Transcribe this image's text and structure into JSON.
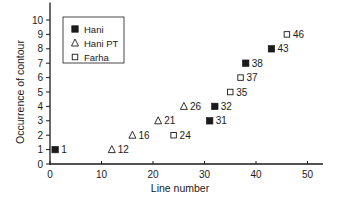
{
  "chart_data": {
    "type": "scatter",
    "title": "",
    "xlabel": "Line number",
    "ylabel": "Occurrence of contour",
    "xlim": [
      0,
      53
    ],
    "ylim": [
      0,
      10.8
    ],
    "xticks": [
      0,
      10,
      20,
      30,
      40,
      50
    ],
    "yticks": [
      0,
      1,
      2,
      3,
      4,
      5,
      6,
      7,
      8,
      9,
      10
    ],
    "grid": false,
    "legend_position": "upper-left",
    "series": [
      {
        "name": "Hani",
        "marker": "filled-square",
        "points": [
          {
            "x": 1,
            "y": 1,
            "label": "1"
          },
          {
            "x": 31,
            "y": 3,
            "label": "31"
          },
          {
            "x": 32,
            "y": 4,
            "label": "32"
          },
          {
            "x": 38,
            "y": 7,
            "label": "38"
          },
          {
            "x": 43,
            "y": 8,
            "label": "43"
          }
        ]
      },
      {
        "name": "Hani PT",
        "marker": "open-triangle",
        "points": [
          {
            "x": 12,
            "y": 1,
            "label": "12"
          },
          {
            "x": 16,
            "y": 2,
            "label": "16"
          },
          {
            "x": 21,
            "y": 3,
            "label": "21"
          },
          {
            "x": 26,
            "y": 4,
            "label": "26"
          }
        ]
      },
      {
        "name": "Farha",
        "marker": "open-square",
        "points": [
          {
            "x": 24,
            "y": 2,
            "label": "24"
          },
          {
            "x": 35,
            "y": 5,
            "label": "35"
          },
          {
            "x": 37,
            "y": 6,
            "label": "37"
          },
          {
            "x": 46,
            "y": 9,
            "label": "46"
          }
        ]
      }
    ]
  },
  "colors": {
    "ink": "#1a1a1a",
    "background": "#ffffff"
  }
}
